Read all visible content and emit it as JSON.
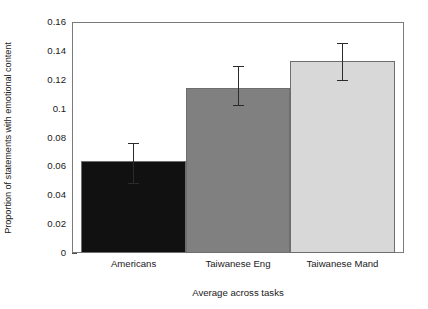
{
  "chart_data": {
    "type": "bar",
    "title": "",
    "subtitle": "",
    "xlabel": "Average across tasks",
    "ylabel": "Proportion of statements with emotional content",
    "categories": [
      "Americans",
      "Taiwanese Eng",
      "Taiwanese Mand"
    ],
    "values": [
      0.064,
      0.1145,
      0.133
    ],
    "error_upper": [
      0.0765,
      0.1295,
      0.1455
    ],
    "error_lower": [
      0.0475,
      0.1015,
      0.119
    ],
    "bar_colors": [
      "#111111",
      "#808080",
      "#d8d8d8"
    ],
    "bar_edge_color": "#6e6e6e",
    "errorbar_color": "#2b2b2b",
    "ylim": [
      0,
      0.16
    ],
    "yticks": [
      0,
      0.02,
      0.04,
      0.06,
      0.08,
      0.1,
      0.12,
      0.14,
      0.16
    ],
    "ytick_labels": [
      "0",
      "0.02",
      "0.04",
      "0.06",
      "0.08",
      "0.1",
      "0.12",
      "0.14",
      "0.16"
    ],
    "grid": false,
    "legend": null,
    "legend_position": "none",
    "frame": true,
    "background_color": "#ffffff"
  },
  "axes": {
    "y_title": "Proportion of statements with emotional content",
    "x_title": "Average across tasks",
    "tick_0": "0",
    "tick_1": "0.02",
    "tick_2": "0.04",
    "tick_3": "0.06",
    "tick_4": "0.08",
    "tick_5": "0.1",
    "tick_6": "0.12",
    "tick_7": "0.14",
    "tick_8": "0.16",
    "cat_0": "Americans",
    "cat_1": "Taiwanese Eng",
    "cat_2": "Taiwanese Mand"
  }
}
